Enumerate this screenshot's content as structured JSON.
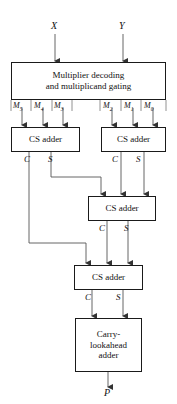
{
  "diagram": {
    "inputs": [
      {
        "id": "x",
        "label": "X"
      },
      {
        "id": "y",
        "label": "Y"
      }
    ],
    "output": {
      "id": "p",
      "label": "P"
    },
    "blocks": [
      {
        "id": "decoder",
        "line1": "Multiplier decoding",
        "line2": "and multiplicand gating"
      },
      {
        "id": "cs-adder-1",
        "label": "CS adder"
      },
      {
        "id": "cs-adder-2",
        "label": "CS adder"
      },
      {
        "id": "cs-adder-3",
        "label": "CS adder"
      },
      {
        "id": "cs-adder-4",
        "label": "CS adder"
      },
      {
        "id": "cla",
        "line1": "Carry-",
        "line2": "lookahead",
        "line3": "adder"
      }
    ],
    "partial_products": [
      {
        "id": "m5",
        "base": "M",
        "index": "5"
      },
      {
        "id": "m4",
        "base": "M",
        "index": "4"
      },
      {
        "id": "m3",
        "base": "M",
        "index": "3"
      },
      {
        "id": "m2",
        "base": "M",
        "index": "2"
      },
      {
        "id": "m1",
        "base": "M",
        "index": "1"
      },
      {
        "id": "m0",
        "base": "M",
        "index": "0"
      }
    ],
    "signals": [
      {
        "id": "c1",
        "label": "C"
      },
      {
        "id": "s1",
        "label": "S"
      },
      {
        "id": "c2",
        "label": "C"
      },
      {
        "id": "s2",
        "label": "S"
      },
      {
        "id": "c3",
        "label": "C"
      },
      {
        "id": "s3",
        "label": "S"
      },
      {
        "id": "c4",
        "label": "C"
      },
      {
        "id": "s4",
        "label": "S"
      }
    ],
    "colors": {
      "line": "#555555",
      "box_border": "#1a1a1a",
      "text": "#111111",
      "background": "#ffffff"
    }
  }
}
